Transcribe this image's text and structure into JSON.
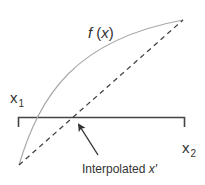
{
  "diagram": {
    "labels": {
      "function": {
        "name": "f",
        "open": " (",
        "arg": "x",
        "close": ")"
      },
      "x1": {
        "base": "x",
        "sub": "1"
      },
      "x2": {
        "base": "x",
        "sub": "2"
      },
      "interpolated": {
        "text": "Interpolated ",
        "var": "x′"
      }
    },
    "elements": {
      "curve": {
        "kind": "solid-curve",
        "represents": "f(x)"
      },
      "chord": {
        "kind": "dashed-line",
        "represents": "linear interpolation secant"
      },
      "bracket": {
        "kind": "interval-bracket",
        "represents": "interval [x1, x2]"
      },
      "arrow": {
        "kind": "pointer-arrow",
        "points_to": "interpolated x′"
      }
    },
    "colors": {
      "curve": "#a8a8a8",
      "chord": "#444444",
      "bracket": "#444444",
      "arrow": "#333333",
      "text": "#333333",
      "background": "#ffffff"
    }
  }
}
